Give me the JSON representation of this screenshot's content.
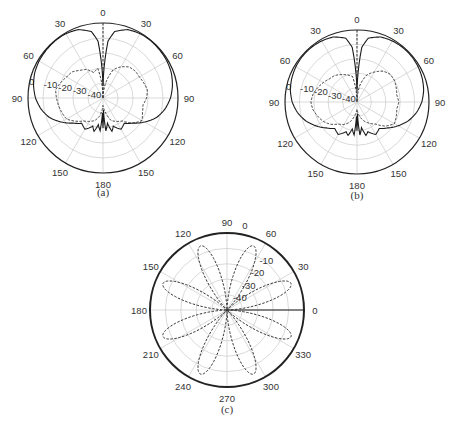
{
  "chart_data": [
    {
      "type": "polar-line",
      "caption": "(a)",
      "center": [
        103,
        98
      ],
      "radius": 75,
      "angle_ticks": [
        "0",
        "30",
        "60",
        "90",
        "120",
        "150",
        "180",
        "150",
        "120",
        "90",
        "60",
        "30"
      ],
      "angle_tick_degrees": [
        0,
        30,
        60,
        90,
        120,
        150,
        180,
        210,
        240,
        270,
        300,
        330
      ],
      "radial_labels": [
        "0",
        "-10",
        "-20",
        "-30",
        "-40"
      ],
      "radial_range_db": [
        -50,
        0
      ],
      "grid": true,
      "series": [
        {
          "name": "co-polar",
          "style": "solid",
          "angles_deg": [
            0,
            5,
            10,
            20,
            30,
            40,
            50,
            60,
            70,
            80,
            90,
            100,
            110,
            120,
            130,
            140,
            150,
            160,
            165,
            170,
            175,
            178,
            180,
            182,
            185,
            190,
            195,
            200,
            210,
            220,
            230,
            240,
            250,
            260,
            270,
            280,
            290,
            300,
            310,
            320,
            330,
            340,
            350,
            355,
            360
          ],
          "values_db": [
            -42,
            -12,
            -5,
            -1.5,
            -0.5,
            -0.3,
            -0.5,
            -0.8,
            -1.5,
            -3,
            -5,
            -8,
            -12,
            -18,
            -24,
            -28,
            -26,
            -30,
            -27,
            -33,
            -28,
            -42,
            -30,
            -40,
            -28,
            -32,
            -27,
            -30,
            -26,
            -28,
            -24,
            -18,
            -12,
            -8,
            -5,
            -3,
            -1.5,
            -0.8,
            -0.5,
            -0.3,
            -0.5,
            -1.5,
            -5,
            -12,
            -42
          ]
        },
        {
          "name": "cross-polar",
          "style": "dashed",
          "angles_deg": [
            0,
            10,
            20,
            30,
            40,
            50,
            60,
            70,
            80,
            90,
            100,
            110,
            120,
            130,
            140,
            150,
            160,
            170,
            180,
            190,
            200,
            210,
            220,
            230,
            240,
            250,
            260,
            270,
            280,
            290,
            300,
            310,
            320,
            330,
            340,
            350,
            360
          ],
          "values_db": [
            -50,
            -40,
            -30,
            -26,
            -23,
            -22,
            -22,
            -21,
            -20,
            -21,
            -23,
            -22,
            -20,
            -24,
            -30,
            -32,
            -34,
            -40,
            -45,
            -38,
            -34,
            -32,
            -30,
            -26,
            -22,
            -21,
            -20,
            -19,
            -18,
            -20,
            -22,
            -23,
            -26,
            -28,
            -32,
            -30,
            -50
          ]
        }
      ]
    },
    {
      "type": "polar-line",
      "caption": "(b)",
      "center": [
        357,
        102
      ],
      "radius": 72,
      "angle_ticks": [
        "0",
        "30",
        "60",
        "90",
        "120",
        "150",
        "180",
        "150",
        "120",
        "90",
        "60",
        "30"
      ],
      "angle_tick_degrees": [
        0,
        30,
        60,
        90,
        120,
        150,
        180,
        210,
        240,
        270,
        300,
        330
      ],
      "radial_labels": [
        "0",
        "-10",
        "-20",
        "-30",
        "-40"
      ],
      "radial_range_db": [
        -50,
        0
      ],
      "grid": true,
      "series": [
        {
          "name": "co-polar",
          "style": "solid",
          "angles_deg": [
            0,
            5,
            10,
            20,
            30,
            40,
            50,
            60,
            70,
            80,
            90,
            100,
            110,
            120,
            130,
            140,
            150,
            160,
            165,
            170,
            175,
            178,
            180,
            182,
            185,
            190,
            195,
            200,
            210,
            220,
            230,
            240,
            250,
            260,
            270,
            280,
            290,
            300,
            310,
            320,
            330,
            340,
            350,
            355,
            360
          ],
          "values_db": [
            -42,
            -12,
            -5,
            -2,
            -1,
            -0.6,
            -0.6,
            -1,
            -1.8,
            -3,
            -5,
            -8,
            -12,
            -17,
            -22,
            -26,
            -24,
            -28,
            -26,
            -32,
            -27,
            -42,
            -30,
            -40,
            -27,
            -31,
            -26,
            -28,
            -24,
            -26,
            -22,
            -17,
            -12,
            -8,
            -5,
            -3,
            -1.8,
            -1,
            -0.6,
            -0.6,
            -1,
            -2,
            -5,
            -12,
            -42
          ]
        },
        {
          "name": "cross-polar",
          "style": "dashed",
          "angles_deg": [
            0,
            10,
            20,
            30,
            40,
            50,
            60,
            70,
            80,
            90,
            100,
            110,
            120,
            130,
            140,
            150,
            160,
            170,
            180,
            190,
            200,
            210,
            220,
            230,
            240,
            250,
            260,
            270,
            280,
            290,
            300,
            310,
            320,
            330,
            340,
            350,
            360
          ],
          "values_db": [
            -50,
            -38,
            -30,
            -26,
            -22,
            -20,
            -20,
            -21,
            -22,
            -21,
            -22,
            -21,
            -20,
            -24,
            -30,
            -33,
            -36,
            -40,
            -45,
            -40,
            -35,
            -32,
            -30,
            -26,
            -23,
            -21,
            -19,
            -18,
            -19,
            -21,
            -23,
            -25,
            -26,
            -28,
            -30,
            -32,
            -50
          ]
        }
      ]
    },
    {
      "type": "polar-line",
      "caption": "(c)",
      "center": [
        227,
        310
      ],
      "radius": 77,
      "angle_ticks": [
        "0",
        "30",
        "60",
        "90",
        "120",
        "150",
        "180",
        "210",
        "240",
        "270",
        "300",
        "330"
      ],
      "angle_tick_degrees": [
        0,
        30,
        60,
        90,
        120,
        150,
        180,
        210,
        240,
        270,
        300,
        330
      ],
      "angle_direction": "counterclockwise-from-east",
      "radial_labels": [
        "0",
        "-10",
        "-20",
        "-30",
        "-40"
      ],
      "radial_range_db": [
        -50,
        0
      ],
      "grid": true,
      "series": [
        {
          "name": "co-polar",
          "style": "solid",
          "description": "circle at 0 dB plus line along 0 deg",
          "values_db_constant": 0
        },
        {
          "name": "cross-polar",
          "style": "dashed",
          "description": "eight-lobe pattern |sin(4*phi)|, lobe peaks near -5 dB, nulls at multiples of 45 deg",
          "lobes": 8,
          "peak_db": -5
        }
      ]
    }
  ],
  "captions": {
    "a": "(a)",
    "b": "(b)",
    "c": "(c)"
  },
  "plot_c_top_label": "0"
}
